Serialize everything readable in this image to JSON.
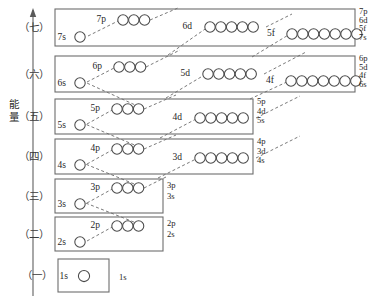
{
  "figure": {
    "title": "",
    "axis": {
      "label": "能量",
      "direction": "up",
      "meaning": "energy-increasing-upward"
    },
    "colors": {
      "box_stroke": "#6d6d6d",
      "circle_stroke": "#4a4a4a",
      "dash_stroke": "#7a7a7a",
      "text": "#1f1f1f",
      "background": "#ffffff"
    }
  },
  "periods": [
    {
      "id": "period-7",
      "label": "（七）",
      "box": {
        "x": 55,
        "y": 9,
        "w": 300,
        "h": 37
      },
      "groups": [
        {
          "name": "7s",
          "label": "7s",
          "count": 1,
          "label_x": 66,
          "label_y": 40,
          "cx0": 80,
          "cy": 37,
          "r": 5.2
        },
        {
          "name": "7p",
          "label": "7p",
          "count": 3,
          "label_x": 106,
          "label_y": 22,
          "cx0": 123,
          "cy": 20,
          "r": 5.2
        },
        {
          "name": "6d",
          "label": "6d",
          "count": 5,
          "label_x": 192,
          "label_y": 29,
          "cx0": 210,
          "cy": 27,
          "r": 5.2
        },
        {
          "name": "5f",
          "label": "5f",
          "count": 7,
          "label_x": 275,
          "label_y": 36,
          "cx0": 292,
          "cy": 34,
          "r": 5.2
        }
      ],
      "right_labels": [
        "7p",
        "6d",
        "5f",
        "7s"
      ]
    },
    {
      "id": "period-6",
      "label": "（六）",
      "box": {
        "x": 55,
        "y": 56,
        "w": 300,
        "h": 36
      },
      "groups": [
        {
          "name": "6s",
          "label": "6s",
          "count": 1,
          "label_x": 66,
          "label_y": 86,
          "cx0": 80,
          "cy": 83,
          "r": 5.2
        },
        {
          "name": "6p",
          "label": "6p",
          "count": 3,
          "label_x": 102,
          "label_y": 69,
          "cx0": 119,
          "cy": 67,
          "r": 5.2
        },
        {
          "name": "5d",
          "label": "5d",
          "count": 5,
          "label_x": 190,
          "label_y": 76,
          "cx0": 208,
          "cy": 74,
          "r": 5.2
        },
        {
          "name": "4f",
          "label": "4f",
          "count": 7,
          "label_x": 274,
          "label_y": 83,
          "cx0": 291,
          "cy": 81,
          "r": 5.2
        }
      ],
      "right_labels": [
        "6p",
        "5d",
        "4f",
        "6s"
      ]
    },
    {
      "id": "period-5",
      "label": "（五）",
      "box": {
        "x": 55,
        "y": 99,
        "w": 198,
        "h": 35
      },
      "groups": [
        {
          "name": "5s",
          "label": "5s",
          "count": 1,
          "label_x": 66,
          "label_y": 128,
          "cx0": 80,
          "cy": 125,
          "r": 5.2
        },
        {
          "name": "5p",
          "label": "5p",
          "count": 3,
          "label_x": 100,
          "label_y": 111,
          "cx0": 117,
          "cy": 109,
          "r": 5.2
        },
        {
          "name": "4d",
          "label": "4d",
          "count": 5,
          "label_x": 182,
          "label_y": 120,
          "cx0": 200,
          "cy": 118,
          "r": 5.2
        }
      ],
      "right_labels": [
        "5p",
        "4d",
        "5s"
      ]
    },
    {
      "id": "period-4",
      "label": "（四）",
      "box": {
        "x": 55,
        "y": 139,
        "w": 198,
        "h": 35
      },
      "groups": [
        {
          "name": "4s",
          "label": "4s",
          "count": 1,
          "label_x": 66,
          "label_y": 168,
          "cx0": 80,
          "cy": 165,
          "r": 5.2
        },
        {
          "name": "4p",
          "label": "4p",
          "count": 3,
          "label_x": 100,
          "label_y": 151,
          "cx0": 117,
          "cy": 149,
          "r": 5.2
        },
        {
          "name": "3d",
          "label": "3d",
          "count": 5,
          "label_x": 182,
          "label_y": 160,
          "cx0": 200,
          "cy": 158,
          "r": 5.2
        }
      ],
      "right_labels": [
        "4p",
        "3d",
        "4s"
      ]
    },
    {
      "id": "period-3",
      "label": "（三）",
      "box": {
        "x": 55,
        "y": 179,
        "w": 108,
        "h": 34
      },
      "groups": [
        {
          "name": "3s",
          "label": "3s",
          "count": 1,
          "label_x": 66,
          "label_y": 207,
          "cx0": 80,
          "cy": 204,
          "r": 5.2
        },
        {
          "name": "3p",
          "label": "3p",
          "count": 3,
          "label_x": 100,
          "label_y": 190,
          "cx0": 117,
          "cy": 188,
          "r": 5.2
        }
      ],
      "right_labels": [
        "3p",
        "3s"
      ]
    },
    {
      "id": "period-2",
      "label": "（二）",
      "box": {
        "x": 55,
        "y": 217,
        "w": 108,
        "h": 34
      },
      "groups": [
        {
          "name": "2s",
          "label": "2s",
          "count": 1,
          "label_x": 66,
          "label_y": 245,
          "cx0": 80,
          "cy": 242,
          "r": 5.2
        },
        {
          "name": "2p",
          "label": "2p",
          "count": 3,
          "label_x": 100,
          "label_y": 228,
          "cx0": 117,
          "cy": 226,
          "r": 5.2
        }
      ],
      "right_labels": [
        "2p",
        "2s"
      ]
    },
    {
      "id": "period-1",
      "label": "（一）",
      "box": {
        "x": 58,
        "y": 259,
        "w": 51,
        "h": 33
      },
      "groups": [
        {
          "name": "1s",
          "label": "1s",
          "count": 1,
          "label_x": 68,
          "label_y": 279,
          "cx0": 84,
          "cy": 276,
          "r": 5.6
        }
      ],
      "right_labels": [
        "1s"
      ]
    }
  ],
  "right_label_columns": [
    {
      "for": "period-7",
      "x": 359,
      "lines": [
        "7p",
        "6d",
        "5f",
        "7s"
      ],
      "y0": 14,
      "dy": 8.6
    },
    {
      "for": "period-6",
      "x": 359,
      "lines": [
        "6p",
        "5d",
        "4f",
        "6s"
      ],
      "y0": 61,
      "dy": 8.6
    },
    {
      "for": "period-5",
      "x": 257,
      "lines": [
        "5p",
        "4d",
        "5s"
      ],
      "y0": 104,
      "dy": 9.6
    },
    {
      "for": "period-4",
      "x": 257,
      "lines": [
        "4p",
        "3d",
        "4s"
      ],
      "y0": 144,
      "dy": 9.6
    },
    {
      "for": "period-3",
      "x": 167,
      "lines": [
        "3p",
        "3s"
      ],
      "y0": 188,
      "dy": 11
    },
    {
      "for": "period-2",
      "x": 167,
      "lines": [
        "2p",
        "2s"
      ],
      "y0": 226,
      "dy": 11
    },
    {
      "for": "period-1",
      "x": 119,
      "lines": [
        "1s"
      ],
      "y0": 280,
      "dy": 11
    }
  ],
  "fill_order_arrows": [
    {
      "name": "arrow-7s-to-7p",
      "d": "M 88 36 L 120 20"
    },
    {
      "name": "arrow-6d-to-7p-chain",
      "d": "M 168 55 L 208 27"
    },
    {
      "name": "arrow-5f-to-6d-chain",
      "d": "M 252 57 L 290 34"
    },
    {
      "name": "arrow-6s-to-6p",
      "d": "M 87 82 L 116 67"
    },
    {
      "name": "arrow-5d-chain-up",
      "d": "M 166 98 L 206 74"
    },
    {
      "name": "arrow-4f-chain-up",
      "d": "M 250 99 L 289 81"
    },
    {
      "name": "arrow-5s-to-5p",
      "d": "M 87 124 L 114 109"
    },
    {
      "name": "arrow-4d-chain-up",
      "d": "M 160 138 L 198 118"
    },
    {
      "name": "arrow-4s-to-4p",
      "d": "M 87 164 L 114 149"
    },
    {
      "name": "arrow-3d-chain-up",
      "d": "M 158 178 L 198 158"
    },
    {
      "name": "arrow-3s-to-3p",
      "d": "M 87 203 L 114 188"
    },
    {
      "name": "arrow-2s-to-2p",
      "d": "M 87 241 L 114 226"
    },
    {
      "name": "arrow-5p-to-6s",
      "d": "M 144 109 L 78 79"
    },
    {
      "name": "arrow-4p-to-5s",
      "d": "M 144 149 L 78 121"
    },
    {
      "name": "arrow-3p-to-4s",
      "d": "M 144 188 L 78 161"
    },
    {
      "name": "arrow-2p-to-3s",
      "d": "M 144 226 L 78 200"
    },
    {
      "name": "arrow-7p-up-right",
      "d": "M 150 20 L 178 8"
    },
    {
      "name": "arrow-6p-up-right",
      "d": "M 146 67 L 180 50"
    },
    {
      "name": "arrow-5p-up-right",
      "d": "M 144 109 L 176 95"
    },
    {
      "name": "arrow-4p-up-right",
      "d": "M 144 149 L 176 135"
    },
    {
      "name": "arrow-3p-up-right",
      "d": "M 144 188 L 168 176"
    },
    {
      "name": "arrow-6d-up-right",
      "d": "M 266 27 L 292 14"
    },
    {
      "name": "arrow-5d-up-right",
      "d": "M 264 74 L 306 52"
    },
    {
      "name": "arrow-4d-up-right",
      "d": "M 256 118 L 300 96"
    },
    {
      "name": "arrow-3d-up-right",
      "d": "M 256 158 L 300 136"
    }
  ],
  "axis": {
    "line": {
      "x": 33,
      "y_top": 10,
      "y_bottom": 296
    },
    "label_x": 14,
    "label_y": 108
  }
}
